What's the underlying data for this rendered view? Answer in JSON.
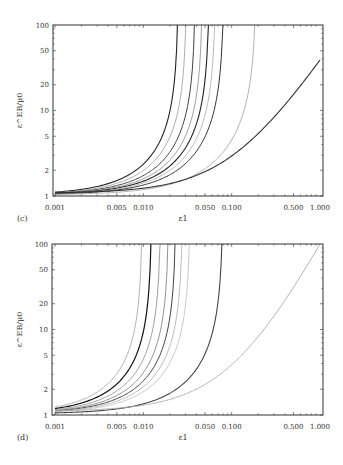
{
  "chart_data": [
    {
      "type": "line",
      "panel": "(c)",
      "xlabel": "ε1",
      "ylabel": "ε^EB/μ0",
      "xscale": "log",
      "yscale": "log",
      "xlim": [
        0.001,
        1.0
      ],
      "ylim": [
        1,
        100
      ],
      "xticks": [
        "0.001",
        "0.005",
        "0.010",
        "0.050",
        "0.100",
        "0.500",
        "1.000"
      ],
      "xtick_values": [
        0.001,
        0.005,
        0.01,
        0.05,
        0.1,
        0.5,
        1.0
      ],
      "yticks": [
        "1",
        "2",
        "5",
        "10",
        "20",
        "50",
        "100"
      ],
      "ytick_values": [
        1,
        2,
        5,
        10,
        20,
        50,
        100
      ],
      "grid": false,
      "series": [
        {
          "name": "curve-1",
          "asymptote": 0.025,
          "color": "#222222",
          "width": 1.1
        },
        {
          "name": "curve-2",
          "asymptote": 0.031,
          "color": "#999999",
          "width": 0.8
        },
        {
          "name": "curve-3",
          "asymptote": 0.039,
          "color": "#444444",
          "width": 1.0
        },
        {
          "name": "curve-4",
          "asymptote": 0.047,
          "color": "#888888",
          "width": 0.8
        },
        {
          "name": "curve-5",
          "asymptote": 0.056,
          "color": "#222222",
          "width": 1.1
        },
        {
          "name": "curve-6",
          "asymptote": 0.066,
          "color": "#aaaaaa",
          "width": 0.8
        },
        {
          "name": "curve-7",
          "asymptote": 0.082,
          "color": "#333333",
          "width": 1.0
        },
        {
          "name": "curve-8",
          "asymptote": 0.19,
          "color": "#aaaaaa",
          "width": 0.9
        },
        {
          "name": "curve-9",
          "asymptote": null,
          "end_value_at_1": 39,
          "color": "#333333",
          "width": 1.1
        }
      ]
    },
    {
      "type": "line",
      "panel": "(d)",
      "xlabel": "ε1",
      "ylabel": "ε^EB/μ0",
      "xscale": "log",
      "yscale": "log",
      "xlim": [
        0.001,
        1.0
      ],
      "ylim": [
        1,
        100
      ],
      "xticks": [
        "0.001",
        "0.005",
        "0.010",
        "0.050",
        "0.100",
        "0.500",
        "1.000"
      ],
      "xtick_values": [
        0.001,
        0.005,
        0.01,
        0.05,
        0.1,
        0.5,
        1.0
      ],
      "yticks": [
        "1",
        "2",
        "5",
        "10",
        "20",
        "50",
        "100"
      ],
      "ytick_values": [
        1,
        2,
        5,
        10,
        20,
        50,
        100
      ],
      "grid": false,
      "series": [
        {
          "name": "curve-1",
          "asymptote": 0.0098,
          "color": "#aaaaaa",
          "width": 0.9
        },
        {
          "name": "curve-2",
          "asymptote": 0.0125,
          "color": "#111111",
          "width": 1.2
        },
        {
          "name": "curve-3",
          "asymptote": 0.0158,
          "color": "#888888",
          "width": 0.8
        },
        {
          "name": "curve-4",
          "asymptote": 0.0195,
          "color": "#777777",
          "width": 0.8
        },
        {
          "name": "curve-5",
          "asymptote": 0.0235,
          "color": "#444444",
          "width": 1.0
        },
        {
          "name": "curve-6",
          "asymptote": 0.028,
          "color": "#aaaaaa",
          "width": 0.8
        },
        {
          "name": "curve-7",
          "asymptote": 0.034,
          "color": "#bbbbbb",
          "width": 0.8
        },
        {
          "name": "curve-8",
          "asymptote": 0.08,
          "color": "#444444",
          "width": 1.1
        },
        {
          "name": "curve-9",
          "asymptote": null,
          "end_value_at_1": 100,
          "color": "#aaaaaa",
          "width": 0.9
        }
      ]
    }
  ]
}
